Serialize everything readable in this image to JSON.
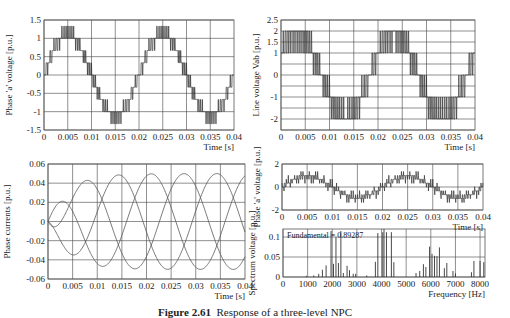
{
  "figure": {
    "caption_label": "Figure 2.61",
    "caption_text": "Response of a three-level NPC"
  },
  "chart_data": [
    {
      "id": "p1",
      "type": "line",
      "title": "",
      "xlabel": "Time [s]",
      "ylabel": "Phase 'a' voltage [p.u.]",
      "xlim": [
        0,
        0.04
      ],
      "ylim": [
        -1.5,
        1.5
      ],
      "xticks": [
        "0",
        "0.005",
        "0.01",
        "0.015",
        "0.02",
        "0.025",
        "0.03",
        "0.035",
        "0.04"
      ],
      "yticks": [
        "1.5",
        "1",
        "0.5",
        "0",
        "-0.5",
        "-1",
        "-1.5"
      ],
      "grid": true,
      "series": [
        {
          "name": "phase-a voltage (multilevel PWM)",
          "fundamental_hz": 50,
          "levels": [
            -1.333,
            -1,
            -0.667,
            -0.333,
            0,
            0.333,
            0.667,
            1,
            1.333
          ]
        }
      ]
    },
    {
      "id": "p2",
      "type": "line",
      "title": "",
      "xlabel": "Time [s]",
      "ylabel": "Line voltage Vab [p.u.]",
      "xlim": [
        0,
        0.04
      ],
      "ylim": [
        -2.5,
        2.5
      ],
      "xticks": [
        "0",
        "0.005",
        "0.01",
        "0.015",
        "0.02",
        "0.025",
        "0.03",
        "0.035",
        "0.04"
      ],
      "yticks": [
        "2.5",
        "2",
        "1.5",
        "1",
        "0",
        "-1",
        "-2"
      ],
      "ytick_values": [
        2.5,
        2,
        1.5,
        1,
        0,
        -1,
        -2
      ],
      "grid": true,
      "series": [
        {
          "name": "Vab (PWM)",
          "fundamental_hz": 50,
          "levels": [
            -2,
            -1,
            0,
            1,
            2
          ]
        }
      ]
    },
    {
      "id": "p3",
      "type": "line",
      "title": "",
      "xlabel": "Time [s]",
      "ylabel": "Phase currents [p.u.]",
      "xlim": [
        0,
        0.04
      ],
      "ylim": [
        -0.06,
        0.06
      ],
      "xticks": [
        "0",
        "0.005",
        "0.01",
        "0.015",
        "0.02",
        "0.025",
        "0.03",
        "0.035",
        "0.04"
      ],
      "yticks": [
        "0.06",
        "0.04",
        "0.02",
        "0",
        "-0.02",
        "-0.04",
        "-0.06"
      ],
      "grid": true,
      "series": [
        {
          "name": "ia",
          "amplitude": 0.05,
          "phase_deg": 0,
          "peak_first": 0.057
        },
        {
          "name": "ib",
          "amplitude": 0.05,
          "phase_deg": -120
        },
        {
          "name": "ic",
          "amplitude": 0.05,
          "phase_deg": 120
        }
      ]
    },
    {
      "id": "p4",
      "type": "line",
      "title": "",
      "xlabel": "Time [s]",
      "ylabel": "Phase 'a' voltage [p.u.]",
      "xlim": [
        0,
        0.04
      ],
      "ylim": [
        -2,
        2
      ],
      "xticks": [
        "0",
        "0.005",
        "0.01",
        "0.015",
        "0.02",
        "0.025",
        "0.03",
        "0.035",
        "0.04"
      ],
      "yticks": [
        "2",
        "0",
        "-2"
      ],
      "grid": true,
      "series": [
        {
          "name": "phase-a voltage",
          "fundamental_hz": 50
        }
      ]
    },
    {
      "id": "p5",
      "type": "bar",
      "title": "",
      "xlabel": "Frequency [Hz]",
      "ylabel": "Spectrum voltage [p.u.]",
      "xlim": [
        0,
        8200
      ],
      "ylim": [
        0,
        0.12
      ],
      "xticks": [
        "0",
        "1000",
        "2000",
        "3000",
        "4000",
        "5000",
        "6000",
        "7000",
        "8000"
      ],
      "yticks": [
        "0.1",
        "0.05",
        "0"
      ],
      "grid": true,
      "annotation": "Fundamental = 0.89287",
      "harmonics": [
        {
          "f": 950,
          "v": 0.003
        },
        {
          "f": 1250,
          "v": 0.004
        },
        {
          "f": 1450,
          "v": 0.008
        },
        {
          "f": 1600,
          "v": 0.018
        },
        {
          "f": 1750,
          "v": 0.029
        },
        {
          "f": 1950,
          "v": 0.115
        },
        {
          "f": 2050,
          "v": 0.033
        },
        {
          "f": 2150,
          "v": 0.1
        },
        {
          "f": 2250,
          "v": 0.035
        },
        {
          "f": 2350,
          "v": 0.115
        },
        {
          "f": 2450,
          "v": 0.01
        },
        {
          "f": 2600,
          "v": 0.028
        },
        {
          "f": 2700,
          "v": 0.017
        },
        {
          "f": 2850,
          "v": 0.008
        },
        {
          "f": 2950,
          "v": 0.008
        },
        {
          "f": 3400,
          "v": 0.004
        },
        {
          "f": 3750,
          "v": 0.038
        },
        {
          "f": 3850,
          "v": 0.11
        },
        {
          "f": 4050,
          "v": 0.112
        },
        {
          "f": 4100,
          "v": 0.12
        },
        {
          "f": 4200,
          "v": 0.112
        },
        {
          "f": 4400,
          "v": 0.112
        },
        {
          "f": 4500,
          "v": 0.037
        },
        {
          "f": 5400,
          "v": 0.01
        },
        {
          "f": 5550,
          "v": 0.015
        },
        {
          "f": 5700,
          "v": 0.032
        },
        {
          "f": 5800,
          "v": 0.025
        },
        {
          "f": 5950,
          "v": 0.076
        },
        {
          "f": 6050,
          "v": 0.058
        },
        {
          "f": 6150,
          "v": 0.053
        },
        {
          "f": 6250,
          "v": 0.052
        },
        {
          "f": 6350,
          "v": 0.074
        },
        {
          "f": 6550,
          "v": 0.022
        },
        {
          "f": 6650,
          "v": 0.035
        },
        {
          "f": 6900,
          "v": 0.015
        },
        {
          "f": 7000,
          "v": 0.009
        },
        {
          "f": 7650,
          "v": 0.012
        },
        {
          "f": 7750,
          "v": 0.04
        },
        {
          "f": 8000,
          "v": 0.04
        },
        {
          "f": 8150,
          "v": 0.037
        }
      ]
    }
  ],
  "layout": {
    "p1": {
      "x": 44,
      "y": 20,
      "w": 190,
      "h": 110
    },
    "p2": {
      "x": 281,
      "y": 20,
      "w": 194,
      "h": 110
    },
    "p3": {
      "x": 48,
      "y": 164,
      "w": 197,
      "h": 115
    },
    "p4": {
      "x": 282,
      "y": 164,
      "w": 201,
      "h": 46
    },
    "p5": {
      "x": 283,
      "y": 229,
      "w": 202,
      "h": 48
    }
  },
  "colors": {
    "axis": "#555555",
    "grid": "#444444",
    "trace": "#333333",
    "text": "#222222"
  }
}
